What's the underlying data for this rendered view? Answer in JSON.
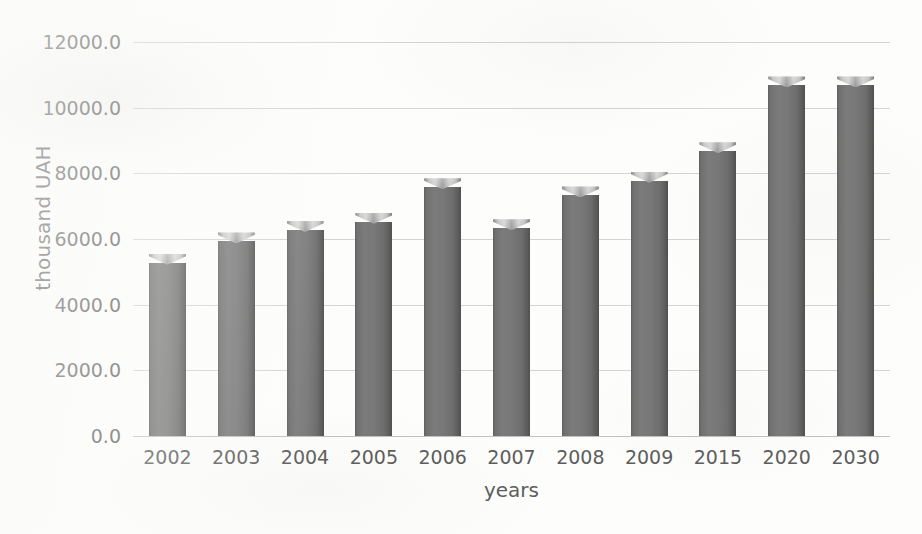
{
  "chart_data": {
    "type": "bar",
    "title": "",
    "subtitle": "",
    "xlabel": "years",
    "ylabel": "thousand UAH",
    "categories": [
      "2002",
      "2003",
      "2004",
      "2005",
      "2006",
      "2007",
      "2008",
      "2009",
      "2015",
      "2020",
      "2030"
    ],
    "values": [
      5550,
      6200,
      6550,
      6800,
      7850,
      6600,
      7600,
      8050,
      8950,
      10950,
      10950
    ],
    "series": [
      {
        "name": "",
        "values": [
          5550,
          6200,
          6550,
          6800,
          7850,
          6600,
          7600,
          8050,
          8950,
          10950,
          10950
        ]
      }
    ],
    "ylim": [
      0,
      12000
    ],
    "ytick_values": [
      0,
      2000,
      4000,
      6000,
      8000,
      10000,
      12000
    ],
    "ytick_labels": [
      "0.0",
      "2000.0",
      "4000.0",
      "6000.0",
      "8000.0",
      "10000.0",
      "12000.0"
    ],
    "grid": true,
    "legend": false,
    "legend_position": "none",
    "bar_color": "#727272",
    "bar_top_color": "#c9c9c9",
    "gridline_color": "#d4d4d4",
    "text_color": "#5d5d5d",
    "background_color": "#fdfdfc",
    "annotations": []
  }
}
